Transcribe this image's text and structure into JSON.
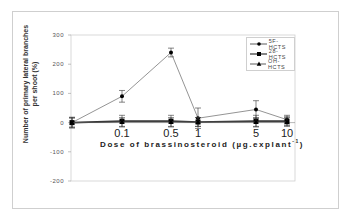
{
  "chart_data": {
    "type": "line",
    "title": "",
    "xlabel": "Dose of brassinosteroid (µg.explant⁻¹)",
    "ylabel": "Number of primary lateral branches per shoot (%)",
    "x": [
      "0",
      "0.1",
      "0.5",
      "1",
      "5",
      "10"
    ],
    "x_tick_labels": [
      "0.1",
      "0.5",
      "1",
      "5",
      "10"
    ],
    "y_ticks": [
      300,
      200,
      100,
      0,
      -100,
      -200
    ],
    "ylim": [
      -200,
      300
    ],
    "grid": false,
    "legend_position": "upper right",
    "series": [
      {
        "name": "5F-HCTS",
        "marker": "circle",
        "values": [
          0,
          90,
          240,
          15,
          45,
          10
        ],
        "errors": [
          18,
          20,
          15,
          35,
          30,
          15
        ]
      },
      {
        "name": "28-HCTS",
        "marker": "square",
        "values": [
          0,
          5,
          5,
          2,
          5,
          5
        ],
        "errors": [
          18,
          20,
          20,
          15,
          20,
          15
        ]
      },
      {
        "name": "OH-HCTS",
        "marker": "triangle",
        "values": [
          0,
          2,
          2,
          2,
          2,
          2
        ],
        "errors": [
          15,
          15,
          15,
          15,
          15,
          15
        ]
      }
    ]
  },
  "axis": {
    "y_ticks": [
      "300",
      "200",
      "100",
      "0",
      "-100",
      "-200"
    ],
    "x_ticks": [
      "0.1",
      "0.5",
      "1",
      "5",
      "10"
    ],
    "ylabel_line1": "Number of primary lateral branches",
    "ylabel_line2": "per shoot (%)",
    "xlabel": "Dose of brassinosteroid (µg.explant",
    "xlabel_sup": "-1",
    "xlabel_end": ")"
  },
  "legend": {
    "items": [
      "5F-HCTS",
      "28-HCTS",
      "OH-HCTS"
    ]
  }
}
